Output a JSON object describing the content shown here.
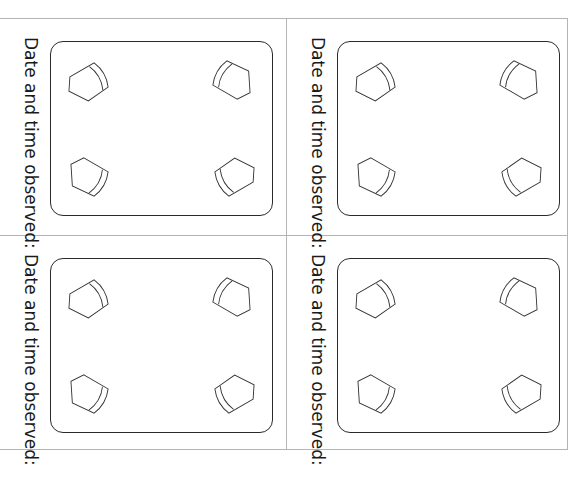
{
  "page": {
    "background": "#ffffff",
    "line_color": "#b4b4b4",
    "box_stroke": "#2a2a2a"
  },
  "cards": [
    {
      "position": "top-left",
      "label": "Date and time observed:",
      "icons": [
        "bucket-icon",
        "bucket-icon",
        "bucket-icon",
        "bucket-icon"
      ]
    },
    {
      "position": "top-right",
      "label": "Date and time observed:",
      "icons": [
        "bucket-icon",
        "bucket-icon",
        "bucket-icon",
        "bucket-icon"
      ]
    },
    {
      "position": "bottom-left",
      "label": "Date and time observed:",
      "icons": [
        "bucket-icon",
        "bucket-icon",
        "bucket-icon",
        "bucket-icon"
      ]
    },
    {
      "position": "bottom-right",
      "label": "Date and time observed:",
      "icons": [
        "bucket-icon",
        "bucket-icon",
        "bucket-icon",
        "bucket-icon"
      ]
    }
  ]
}
